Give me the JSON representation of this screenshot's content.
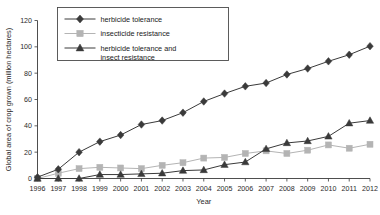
{
  "chart_data": {
    "type": "line",
    "title": "",
    "xlabel": "Year",
    "ylabel": "Global area of crop grown (million hectares)",
    "x": [
      1996,
      1997,
      1998,
      1999,
      2000,
      2001,
      2002,
      2003,
      2004,
      2005,
      2006,
      2007,
      2008,
      2009,
      2010,
      2011,
      2012
    ],
    "xtick_labels": [
      "1996",
      "1997",
      "1998",
      "1999",
      "2000",
      "2001",
      "2002",
      "2003",
      "2004",
      "2005",
      "2006",
      "2007",
      "2008",
      "2009",
      "2010",
      "2011",
      "2012"
    ],
    "ytick_labels": [
      "0",
      "20",
      "40",
      "60",
      "80",
      "100",
      "120"
    ],
    "yticks": [
      0,
      20,
      40,
      60,
      80,
      100,
      120
    ],
    "ylim": [
      0,
      120
    ],
    "xlim": [
      1996,
      2012
    ],
    "grid": false,
    "legend_position": "top-left-inside",
    "series": [
      {
        "name": "herbicide tolerance",
        "marker": "diamond",
        "color": "#3a3a3a",
        "values": [
          1,
          7,
          20,
          28,
          33,
          41,
          44,
          50,
          58.5,
          64.5,
          70,
          72.5,
          79,
          83.5,
          89,
          94,
          100.5
        ]
      },
      {
        "name": "insecticide resistance",
        "marker": "square",
        "color": "#b4b4b4",
        "values": [
          0,
          4,
          7.5,
          8.5,
          8,
          7.5,
          10,
          12,
          15.5,
          16,
          19,
          21,
          19,
          21.5,
          25.5,
          23,
          26
        ]
      },
      {
        "name": "herbicide tolerance and insect resistance",
        "marker": "triangle",
        "color": "#3a3a3a",
        "values": [
          0,
          0,
          0,
          3,
          3,
          3.5,
          4,
          6,
          6.5,
          10.5,
          12.5,
          22.5,
          27,
          28.5,
          32,
          42,
          44
        ]
      }
    ],
    "legend_entries": [
      {
        "label": "herbicide tolerance",
        "marker": "diamond",
        "color": "#3a3a3a"
      },
      {
        "label": "insecticide resistance",
        "marker": "square",
        "color": "#b4b4b4"
      },
      {
        "label": "herbicide tolerance and",
        "label2": "insect resistance",
        "marker": "triangle",
        "color": "#3a3a3a"
      }
    ]
  }
}
